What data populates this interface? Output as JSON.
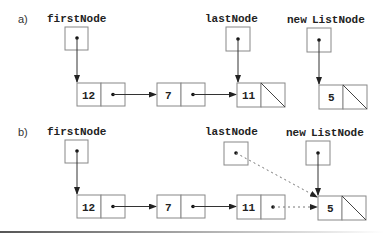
{
  "diagram": {
    "type": "linked-list-append",
    "part_a": {
      "label": "a)",
      "pointers": {
        "first": "firstNode",
        "last": "lastNode",
        "new_prefix": "new",
        "new_suffix": "ListNode"
      },
      "nodes": [
        {
          "value": "12",
          "next": "7"
        },
        {
          "value": "7",
          "next": "11"
        },
        {
          "value": "11",
          "next": "null"
        },
        {
          "value": "5",
          "next": "null"
        }
      ]
    },
    "part_b": {
      "label": "b)",
      "pointers": {
        "first": "firstNode",
        "last": "lastNode",
        "new_prefix": "new",
        "new_suffix": "ListNode"
      },
      "nodes": [
        {
          "value": "12",
          "next": "7"
        },
        {
          "value": "7",
          "next": "11"
        },
        {
          "value": "11",
          "next": "5 (dashed, new link)"
        },
        {
          "value": "5",
          "next": "null"
        }
      ],
      "notes": "lastNode points (dashed) to new node 5"
    }
  }
}
